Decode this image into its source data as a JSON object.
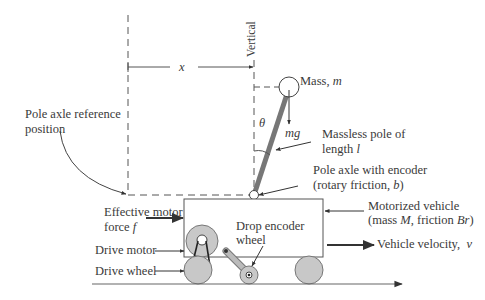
{
  "labels": {
    "vertical": "Vertical",
    "x_symbol": "x",
    "mass_label": "Mass,",
    "mass_symbol": "m",
    "theta_symbol": "θ",
    "mg_symbol": "mg",
    "pole_line1": "Massless pole of",
    "pole_line2_prefix": "length",
    "pole_symbol": "l",
    "reference_line1": "Pole axle reference",
    "reference_line2": "position",
    "axle_line1": "Pole axle with encoder",
    "axle_line2_prefix": "(rotary friction,",
    "axle_symbol": "b",
    "axle_line2_suffix": ")",
    "force_line1": "Effective motor",
    "force_line2_prefix": "force",
    "force_symbol": "f",
    "vehicle_line1": "Motorized vehicle",
    "vehicle_line2_prefix": "(mass",
    "vehicle_mass_symbol": "M",
    "vehicle_line2_mid": ", friction",
    "vehicle_friction_symbol": "Br",
    "vehicle_line2_suffix": ")",
    "drop_line1": "Drop encoder",
    "drop_line2": "wheel",
    "drive_motor": "Drive motor",
    "drive_wheel": "Drive wheel",
    "velocity_prefix": "Vehicle velocity,",
    "velocity_symbol": "v"
  },
  "colors": {
    "line": "#555555",
    "pole": "#777777",
    "wheel_fill": "#c8c8c8",
    "wheel_stroke": "#777777"
  }
}
